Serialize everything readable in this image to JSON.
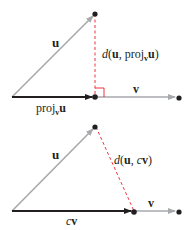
{
  "colors": {
    "vector_u": "#a7a9ac",
    "vector_v": "#a7a9ac",
    "projection": "#231f20",
    "distance": "#ed1c24",
    "point": "#231f20"
  },
  "top_diagram": {
    "u_label": "u",
    "v_label": "v",
    "proj_label_prefix": "proj",
    "proj_label_sub": "v",
    "proj_label_suffix": "u",
    "distance_label": {
      "d": "d",
      "open": "(",
      "u": "u",
      "comma": ", ",
      "proj": "proj",
      "sub": "v",
      "u2": "u",
      "close": ")"
    }
  },
  "bottom_diagram": {
    "u_label": "u",
    "v_label": "v",
    "cv_label_c": "c",
    "cv_label_v": "v",
    "distance_label": {
      "d": "d",
      "open": "(",
      "u": "u",
      "comma": ", ",
      "c": "c",
      "v": "v",
      "close": ")"
    }
  }
}
